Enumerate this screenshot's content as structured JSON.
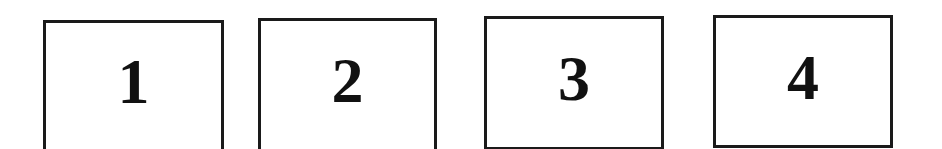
{
  "boxes": [
    {
      "label": "1",
      "left": 43,
      "top": 20,
      "width": 181,
      "height": 132
    },
    {
      "label": "2",
      "left": 258,
      "top": 18,
      "width": 179,
      "height": 134
    },
    {
      "label": "3",
      "left": 484,
      "top": 16,
      "width": 180,
      "height": 134
    },
    {
      "label": "4",
      "left": 713,
      "top": 15,
      "width": 180,
      "height": 133
    }
  ],
  "colors": {
    "border": "#1a1a1a",
    "text": "#111111",
    "background": "#ffffff"
  }
}
